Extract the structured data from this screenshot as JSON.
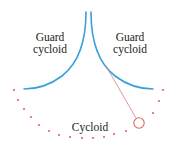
{
  "diagram": {
    "labels": {
      "guard_left_line1": "Guard",
      "guard_left_line2": "cycloid",
      "guard_right_line1": "Guard",
      "guard_right_line2": "cycloid",
      "cycloid": "Cycloid"
    },
    "colors": {
      "guard_curve": "#3aa0d8",
      "cycloid_dots": "#e06666",
      "string": "#d08080",
      "bob": "#e06666",
      "text": "#222222"
    },
    "elements": [
      "left guard cycloid (blue curve)",
      "right guard cycloid (blue curve)",
      "dotted cycloid path (red dots)",
      "pendulum string",
      "pendulum bob (circle)"
    ]
  }
}
